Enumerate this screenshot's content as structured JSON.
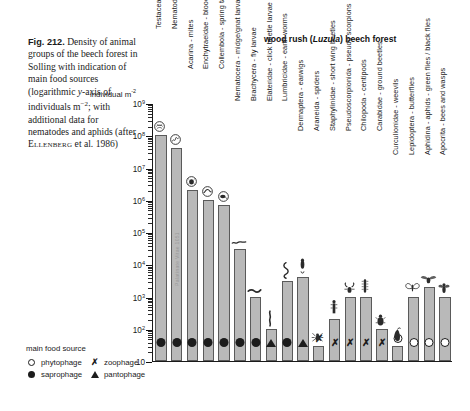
{
  "caption": {
    "figure_number": "Fig. 212.",
    "text_lines": [
      "Density of",
      "animal groups of",
      "the beech forest in",
      "Solling with indica-",
      "tion of main food",
      "sources (logarith-",
      "mic y-axis of indi-",
      "viduals m−2; with",
      "additional data for",
      "nematodes and",
      "aphids (after",
      "ELLENBERG et al.",
      "1986)"
    ],
    "full_text": "Fig. 212. Density of animal groups of the beech forest in Solling with indication of main food sources (logarithmic y-axis of individuals m-2; with additional data for nematodes and aphids (after ELLENBERG et al. 1986)"
  },
  "chart_data": {
    "type": "bar",
    "title": "wood rush (Luzula) beech forest",
    "title_italic_part": "Luzula",
    "ylabel": "individual m-2",
    "ylabel_plain": "individual m",
    "ylabel_exponent": "-2",
    "xlabel": "",
    "log_scale": true,
    "ylim": [
      10,
      1000000000
    ],
    "ytick_labels": [
      "10⁹",
      "10⁸",
      "10⁷",
      "10⁶",
      "10⁵",
      "10⁴",
      "10³",
      "10²",
      "10"
    ],
    "ytick_mantissas": [
      "10",
      "10",
      "10",
      "10",
      "10",
      "10",
      "10",
      "10",
      "10"
    ],
    "ytick_exponents": [
      "9",
      "8",
      "7",
      "6",
      "5",
      "4",
      "3",
      "2",
      ""
    ],
    "ytick_values": [
      1000000000,
      100000000,
      10000000,
      1000000,
      100000,
      10000,
      1000,
      100,
      10
    ],
    "grid": false,
    "legend_position": "bottom-left",
    "watermark_text": "Palatinate Vitae 1051",
    "categories": [
      "Testacea",
      "Nematodes - thread worms",
      "Acarina - mites",
      "Enchytraeidae - blood worms",
      "Collembola - spring tails",
      "Nematocera - midge/gnat larvae",
      "Brachycera - fly larvae",
      "Elateridae - click beetle larvae",
      "Lumbricidae - earth worms",
      "Dermaptera - earwigs",
      "Araneida - spiders",
      "Staphylinidae - short wing beetles",
      "Pseudoscorpionida - pseudo scorpions",
      "Chilopoda - centipods",
      "Carabidae - ground beetles",
      "Curculionidae - weevils",
      "Lepidoptera - butterflies",
      "Aphidina - aphids - green flies / black flies",
      "Apocrita - bees and wasps"
    ],
    "values": [
      100000000,
      40000000,
      2000000,
      1000000,
      700000,
      30000,
      1000,
      100,
      3000,
      4000,
      30,
      200,
      1000,
      1000,
      100,
      30,
      1000,
      2000,
      1000
    ],
    "food_source": [
      "saprophage",
      "saprophage",
      "saprophage",
      "saprophage",
      "saprophage",
      "saprophage",
      "saprophage",
      "pantophage",
      "saprophage",
      "pantophage",
      "zoophage",
      "zoophage",
      "zoophage",
      "zoophage",
      "zoophage",
      "phytophage",
      "phytophage",
      "phytophage",
      "phytophage"
    ],
    "organism_icons": [
      "testacea-shell-icon",
      "nematode-worm-icon",
      "mite-icon",
      "enchytraeid-worm-icon",
      "springtail-icon",
      "midge-larva-icon",
      "fly-larva-icon",
      "click-beetle-larva-icon",
      "earthworm-icon",
      "earwig-icon",
      "spider-icon",
      "rove-beetle-icon",
      "pseudoscorpion-icon",
      "centipede-icon",
      "ground-beetle-icon",
      "weevil-icon",
      "butterfly-icon",
      "aphid-icon",
      "wasp-icon"
    ]
  },
  "legend": {
    "title": "main food source",
    "items": [
      {
        "symbol": "open-circle",
        "label": "phytophage"
      },
      {
        "symbol": "cross",
        "label": "zoophage"
      },
      {
        "symbol": "filled-circle",
        "label": "saprophage"
      },
      {
        "symbol": "triangle",
        "label": "pantophage"
      }
    ]
  },
  "colors": {
    "bar_fill": "#b9b9b9",
    "bar_stroke": "#5a5a5a",
    "axis": "#1a1a1a",
    "text": "#1a1a1a",
    "background": "#ffffff"
  }
}
